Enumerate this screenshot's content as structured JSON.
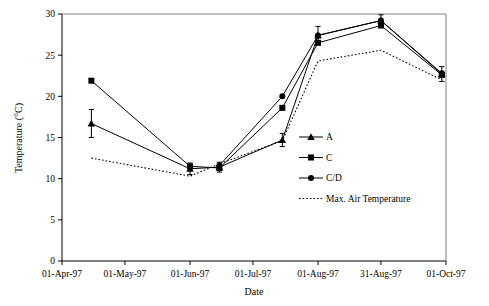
{
  "chart_data": {
    "type": "line",
    "title": "",
    "xlabel": "Date",
    "ylabel": "Temperature (°C)",
    "xtick_labels": [
      "01-Apr-97",
      "01-May-97",
      "01-Jun-97",
      "01-Jul-97",
      "01-Aug-97",
      "31-Aug-97",
      "01-Oct-97"
    ],
    "ytick_labels": [
      "0",
      "5",
      "10",
      "15",
      "20",
      "25",
      "30"
    ],
    "ylim": [
      0,
      30
    ],
    "ytick_step": 5,
    "grid": false,
    "legend_position": "center-right-inside",
    "x_positions_days": [
      14,
      61,
      75,
      105,
      122,
      152,
      181
    ],
    "x_axis_days_range": [
      0,
      183
    ],
    "series": [
      {
        "name": "A",
        "marker": "triangle",
        "line_style": "solid",
        "color": "#000000",
        "x_days": [
          14,
          61,
          75,
          105,
          122,
          152,
          181
        ],
        "values": [
          16.7,
          11.2,
          11.4,
          14.7,
          27.4,
          29.2,
          22.7
        ],
        "error_bars": [
          1.7,
          0.7,
          0.6,
          0.8,
          1.1,
          0.7,
          0.9
        ]
      },
      {
        "name": "C",
        "marker": "square",
        "line_style": "solid",
        "color": "#000000",
        "x_days": [
          14,
          61,
          75,
          105,
          122,
          152,
          181
        ],
        "values": [
          21.9,
          11.5,
          11.3,
          18.6,
          26.5,
          28.6,
          22.6
        ],
        "error_bars": [
          0,
          0,
          0,
          0,
          0,
          0,
          0
        ]
      },
      {
        "name": "C/D",
        "marker": "circle",
        "line_style": "solid",
        "color": "#000000",
        "x_days": [
          75,
          105,
          122,
          152,
          181
        ],
        "values": [
          11.6,
          20.0,
          27.4,
          29.2,
          22.8
        ],
        "error_bars": [
          0,
          0,
          0,
          0,
          0
        ]
      },
      {
        "name": "Max. Air Temperature",
        "marker": "none",
        "line_style": "dotted",
        "color": "#000000",
        "x_days": [
          14,
          61,
          75,
          105,
          122,
          152,
          181
        ],
        "values": [
          12.5,
          10.3,
          11.8,
          14.6,
          24.3,
          25.6,
          22.0
        ],
        "error_bars": [
          0,
          0,
          0,
          0,
          0,
          0,
          0
        ]
      }
    ]
  },
  "legend": {
    "entries": [
      {
        "label": "A",
        "marker": "triangle",
        "style": "solid"
      },
      {
        "label": "C",
        "marker": "square",
        "style": "solid"
      },
      {
        "label": "C/D",
        "marker": "circle",
        "style": "solid"
      },
      {
        "label": "Max. Air Temperature",
        "marker": "none",
        "style": "dotted"
      }
    ]
  }
}
